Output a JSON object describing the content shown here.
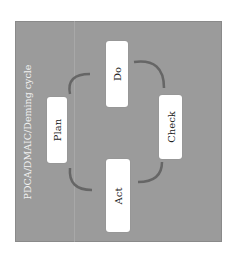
{
  "diagram": {
    "title": "PDCA/DMAIC/Deming cycle",
    "orientation": "rotated -90deg",
    "steps": [
      {
        "label": "Plan"
      },
      {
        "label": "Do"
      },
      {
        "label": "Check"
      },
      {
        "label": "Act"
      }
    ],
    "colors": {
      "background": "#9b9b9b",
      "box": "#ffffff",
      "arrow": "#666666",
      "title": "#f2f2f2"
    }
  }
}
